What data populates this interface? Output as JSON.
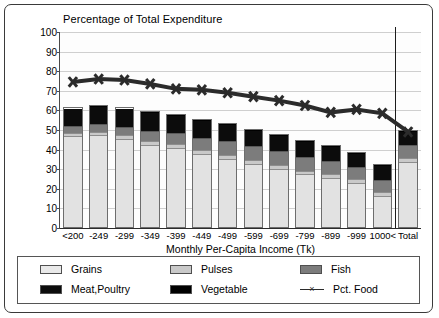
{
  "chart_data": {
    "type": "bar",
    "stacked": true,
    "title": "Percentage of Total Expenditure",
    "xlabel": "Monthly Per-Capita Income (Tk)",
    "ylabel": "",
    "ylim": [
      0,
      100
    ],
    "yticks": [
      0,
      10,
      20,
      30,
      40,
      50,
      60,
      70,
      80,
      90,
      100
    ],
    "grid": true,
    "legend_position": "bottom",
    "categories": [
      "<200",
      "-249",
      "-299",
      "-349",
      "-399",
      "-449",
      "-499",
      "-599",
      "-699",
      "-799",
      "-899",
      "-999",
      "1000<",
      "Total"
    ],
    "series": [
      {
        "name": "Grains",
        "type": "bar",
        "color": "#e2e2e2",
        "values": [
          47.0,
          47.5,
          45.5,
          42.5,
          41.0,
          38.0,
          35.5,
          33.0,
          30.5,
          27.5,
          25.5,
          23.0,
          16.5,
          34.0
        ]
      },
      {
        "name": "Pulses",
        "type": "bar",
        "color": "#c9c9c9",
        "values": [
          2.0,
          2.0,
          2.0,
          2.0,
          2.0,
          2.0,
          2.0,
          2.0,
          2.0,
          2.0,
          2.0,
          2.0,
          2.0,
          2.0
        ]
      },
      {
        "name": "Fish",
        "type": "bar",
        "color": "#7c7c7c",
        "values": [
          3.5,
          4.0,
          4.5,
          5.5,
          6.0,
          6.5,
          7.0,
          7.0,
          7.0,
          7.0,
          7.0,
          6.5,
          6.5,
          6.5
        ]
      },
      {
        "name": "Meat,Poultry",
        "type": "bar",
        "color": "#0c0c0c",
        "values": [
          8.5,
          9.0,
          9.0,
          9.0,
          8.5,
          8.5,
          8.5,
          8.0,
          8.0,
          8.0,
          7.5,
          7.0,
          7.0,
          7.0
        ]
      },
      {
        "name": "Vegetable",
        "type": "bar",
        "color": "#000000",
        "values": [
          0.5,
          0.5,
          0.5,
          0.5,
          0.5,
          0.5,
          0.5,
          0.5,
          0.5,
          0.5,
          0.5,
          0.5,
          0.5,
          0.5
        ]
      },
      {
        "name": "Pct. Food",
        "type": "line",
        "color": "#2b2b2b",
        "marker": "x",
        "values": [
          74.5,
          76.0,
          75.5,
          73.5,
          71.0,
          70.5,
          69.0,
          67.0,
          65.0,
          62.5,
          59.0,
          60.5,
          58.5,
          49.0
        ]
      }
    ],
    "bar_totals": [
      61.5,
      63.0,
      61.5,
      59.5,
      58.0,
      55.5,
      53.5,
      50.5,
      48.0,
      45.0,
      42.5,
      39.0,
      32.5,
      50.0
    ],
    "divider_after_category": "1000<"
  },
  "legend": {
    "items": [
      {
        "label": "Grains",
        "swatch": "grains"
      },
      {
        "label": "Pulses",
        "swatch": "pulses"
      },
      {
        "label": "Fish",
        "swatch": "fish"
      },
      {
        "label": "Meat,Poultry",
        "swatch": "meat"
      },
      {
        "label": "Vegetable",
        "swatch": "veg"
      },
      {
        "label": "Pct. Food",
        "swatch": "line"
      }
    ]
  }
}
